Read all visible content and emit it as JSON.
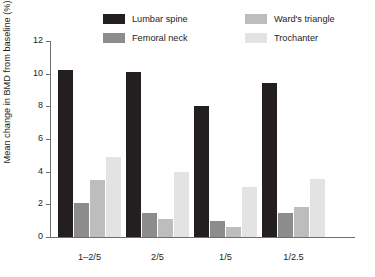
{
  "chart_data": {
    "type": "bar",
    "title": "",
    "xlabel": "",
    "ylabel": "Mean change in BMD from baseline (%)",
    "categories": [
      "1–2/5",
      "2/5",
      "1/5",
      "1/2.5"
    ],
    "ylim": [
      0,
      12
    ],
    "yticks": [
      0,
      2,
      4,
      6,
      8,
      10,
      12
    ],
    "ytick_labels": [
      "0",
      "2",
      "4",
      "6",
      "8",
      "10",
      "12"
    ],
    "grid": false,
    "legend_position": "top",
    "series": [
      {
        "name": "Lumbar spine",
        "color": "#231f20",
        "values": [
          10.2,
          10.1,
          8.05,
          9.45
        ]
      },
      {
        "name": "Femoral neck",
        "color": "#8c8c8c",
        "values": [
          2.1,
          1.5,
          1.0,
          1.45
        ]
      },
      {
        "name": "Ward's triangle",
        "color": "#bdbdbd",
        "values": [
          3.5,
          1.1,
          0.6,
          1.85
        ]
      },
      {
        "name": "Trochanter",
        "color": "#e3e3e3",
        "values": [
          4.9,
          3.95,
          3.05,
          3.55
        ]
      }
    ]
  }
}
